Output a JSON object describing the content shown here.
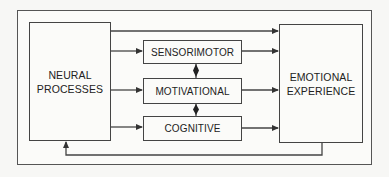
{
  "diagram": {
    "type": "flow",
    "nodes": {
      "neural": {
        "label": "NEURAL PROCESSES",
        "line1": "NEURAL",
        "line2": "PROCESSES"
      },
      "sensorimotor": {
        "label": "SENSORIMOTOR"
      },
      "motivational": {
        "label": "MOTIVATIONAL"
      },
      "cognitive": {
        "label": "COGNITIVE"
      },
      "emotional": {
        "label": "EMOTIONAL EXPERIENCE",
        "line1": "EMOTIONAL",
        "line2": "EXPERIENCE"
      }
    },
    "edges": [
      {
        "from": "NEURAL PROCESSES",
        "to": "EMOTIONAL EXPERIENCE",
        "kind": "direct-arrow"
      },
      {
        "from": "NEURAL PROCESSES",
        "to": "SENSORIMOTOR",
        "kind": "arrow"
      },
      {
        "from": "NEURAL PROCESSES",
        "to": "MOTIVATIONAL",
        "kind": "arrow"
      },
      {
        "from": "NEURAL PROCESSES",
        "to": "COGNITIVE",
        "kind": "arrow"
      },
      {
        "from": "SENSORIMOTOR",
        "to": "EMOTIONAL EXPERIENCE",
        "kind": "arrow"
      },
      {
        "from": "MOTIVATIONAL",
        "to": "EMOTIONAL EXPERIENCE",
        "kind": "arrow"
      },
      {
        "from": "COGNITIVE",
        "to": "EMOTIONAL EXPERIENCE",
        "kind": "arrow"
      },
      {
        "from": "SENSORIMOTOR",
        "to": "MOTIVATIONAL",
        "kind": "bidirectional"
      },
      {
        "from": "MOTIVATIONAL",
        "to": "COGNITIVE",
        "kind": "bidirectional"
      },
      {
        "from": "EMOTIONAL EXPERIENCE",
        "to": "NEURAL PROCESSES",
        "kind": "feedback-arrow"
      }
    ],
    "colors": {
      "line": "#444444",
      "background": "#fbfbf9"
    }
  }
}
